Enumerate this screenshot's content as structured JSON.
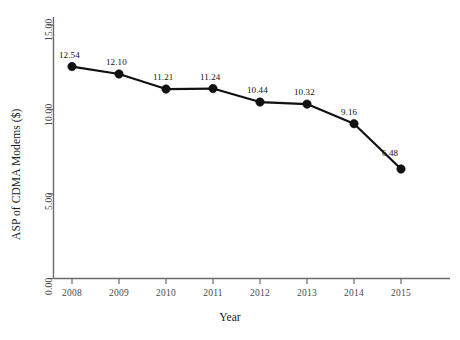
{
  "chart_data": {
    "type": "line",
    "title": "",
    "xlabel": "Year",
    "ylabel": "ASP of CDMA Modems ($)",
    "categories": [
      "2008",
      "2009",
      "2010",
      "2011",
      "2012",
      "2013",
      "2014",
      "2015"
    ],
    "values": [
      12.54,
      12.1,
      11.21,
      11.24,
      10.44,
      10.32,
      9.16,
      6.48
    ],
    "point_labels": [
      "12.54",
      "12.10",
      "11.21",
      "11.24",
      "10.44",
      "10.32",
      "9.16",
      "6.48"
    ],
    "ylim": [
      0,
      15
    ],
    "ytick_labels": [
      "0.00",
      "5.00",
      "10.00",
      "15.00"
    ],
    "ytick_values": [
      0,
      5,
      10,
      15
    ],
    "grid": false,
    "legend": "none",
    "series_color": "#111111",
    "axis_color": "#6b6b6b",
    "background_color": "#ffffff",
    "marker": "circle"
  }
}
